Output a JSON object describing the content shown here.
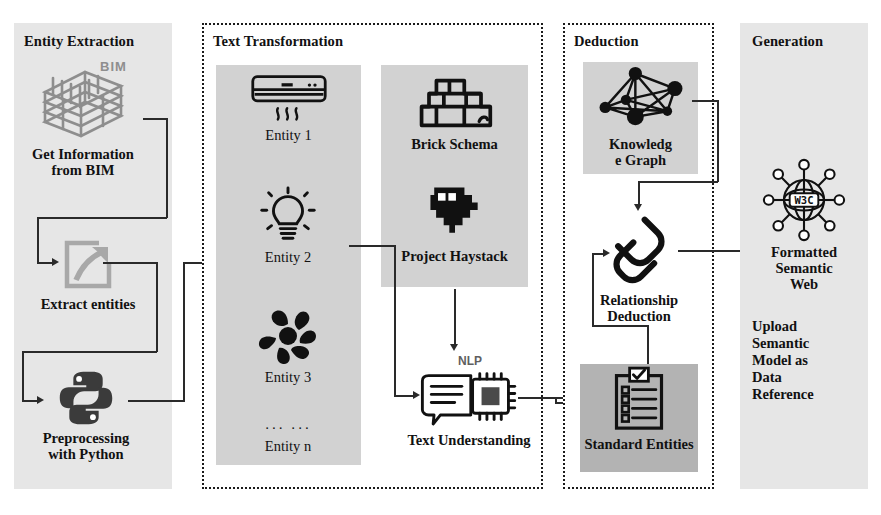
{
  "diagram": {
    "colors": {
      "panel_shaded": "#e6e6e6",
      "subbox_light": "#d2d2d2",
      "subbox_dark": "#b3b3b3",
      "stroke": "#2a2a2a",
      "icon_gray": "#8e8e8e",
      "icon_dark": "#3b3b3b",
      "background": "#ffffff"
    }
  },
  "panels": [
    {
      "id": "entity-extraction",
      "title": "Entity Extraction",
      "style": "shaded"
    },
    {
      "id": "text-transformation",
      "title": "Text Transformation",
      "style": "dotted"
    },
    {
      "id": "deduction",
      "title": "Deduction",
      "style": "dotted"
    },
    {
      "id": "generation",
      "title": "Generation",
      "style": "shaded"
    }
  ],
  "entity_extraction": {
    "bim_badge": "BIM",
    "nodes": [
      {
        "id": "get-information-from-bim",
        "icon": "bim-building-icon",
        "caption": "Get Information\nfrom BIM"
      },
      {
        "id": "extract-entities",
        "icon": "extract-arrow-icon",
        "caption": "Extract entities"
      },
      {
        "id": "preprocessing-with-python",
        "icon": "python-icon",
        "caption": "Preprocessing\nwith Python"
      }
    ]
  },
  "text_transformation": {
    "entities_box": {
      "id": "entities-list-box",
      "items": [
        {
          "id": "entity-1",
          "icon": "air-conditioner-icon",
          "caption": "Entity 1"
        },
        {
          "id": "entity-2",
          "icon": "light-bulb-icon",
          "caption": "Entity 2"
        },
        {
          "id": "entity-3",
          "icon": "fan-icon",
          "caption": "Entity 3"
        },
        {
          "id": "entity-n",
          "icon": "ellipsis",
          "caption": "Entity n",
          "ellipsis": "··· ···"
        }
      ]
    },
    "schemas_box": {
      "id": "schemas-box",
      "items": [
        {
          "id": "brick-schema",
          "icon": "brick-wall-icon",
          "caption": "Brick Schema"
        },
        {
          "id": "project-haystack",
          "icon": "haystack-stack-icon",
          "caption": "Project Haystack"
        }
      ]
    },
    "text_understanding": {
      "id": "text-understanding",
      "icon": "nlp-chip-chat-icon",
      "badge": "NLP",
      "caption": "Text Understanding"
    }
  },
  "deduction": {
    "knowledge_graph": {
      "id": "knowledge-graph",
      "icon": "knowledge-graph-icon",
      "caption": "Knowledg\ne Graph"
    },
    "relationship_deduction": {
      "id": "relationship-deduction",
      "icon": "chain-link-icon",
      "caption": "Relationship\nDeduction"
    },
    "standard_entities": {
      "id": "standard-entities",
      "icon": "checklist-clipboard-icon",
      "caption": "Standard Entities"
    }
  },
  "generation": {
    "formatted_semantic_web": {
      "id": "formatted-semantic-web",
      "icon": "w3c-globe-icon",
      "badge": "W3C",
      "caption": "Formatted\nSemantic\nWeb"
    },
    "note": "Upload\nSemantic\nModel as\nData\nReference"
  }
}
